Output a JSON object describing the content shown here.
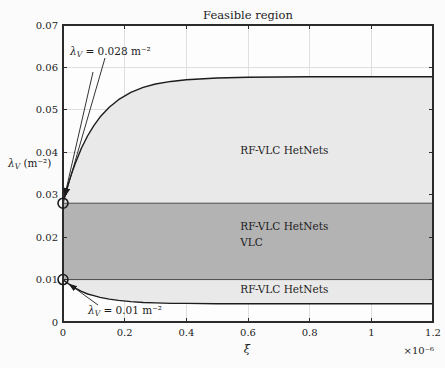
{
  "colors": {
    "background": "#fbfbfb",
    "plot_bg": "#fdfdfd",
    "light_region_fill": "#e9e9e9",
    "dark_region_fill": "#b3b3b3",
    "grid": "#dcdcdc",
    "axis": "#2b2b2b",
    "band_edge": "#4a4a4a",
    "curve": "#1c1c1c",
    "text": "#1c1c1c"
  },
  "chart_data": {
    "type": "area",
    "title": "Feasible region",
    "xlabel": "ξ",
    "x_scale_label": "×10⁻⁶",
    "ylabel": {
      "pre": "λ",
      "sub": "V",
      "post": " (m⁻²)"
    },
    "xlim": [
      0,
      1.2
    ],
    "ylim": [
      0,
      0.07
    ],
    "grid": true,
    "xticks": {
      "values": [
        0,
        0.2,
        0.4,
        0.6,
        0.8,
        1,
        1.2
      ],
      "labels": [
        "0",
        "0.2",
        "0.4",
        "0.6",
        "0.8",
        "1",
        "1.2"
      ]
    },
    "yticks": {
      "values": [
        0,
        0.01,
        0.02,
        0.03,
        0.04,
        0.05,
        0.06,
        0.07
      ],
      "labels": [
        "0",
        "0.01",
        "0.02",
        "0.03",
        "0.04",
        "0.05",
        "0.06",
        "0.07"
      ]
    },
    "series": [
      {
        "name": "upper-boundary-curve",
        "x": [
          0,
          0.01,
          0.02,
          0.03,
          0.04,
          0.06,
          0.08,
          0.1,
          0.12,
          0.15,
          0.18,
          0.22,
          0.26,
          0.3,
          0.35,
          0.4,
          0.5,
          0.6,
          0.8,
          1.0,
          1.2
        ],
        "y": [
          0.028,
          0.0307,
          0.0332,
          0.0354,
          0.0374,
          0.041,
          0.0439,
          0.0463,
          0.0483,
          0.0506,
          0.0524,
          0.0541,
          0.0553,
          0.0561,
          0.0567,
          0.0571,
          0.0575,
          0.0577,
          0.0578,
          0.0578,
          0.0578
        ]
      },
      {
        "name": "lower-boundary-curve",
        "x": [
          0,
          0.01,
          0.02,
          0.03,
          0.04,
          0.06,
          0.08,
          0.1,
          0.12,
          0.15,
          0.18,
          0.22,
          0.26,
          0.3,
          0.35,
          0.4,
          0.5,
          0.6,
          0.8,
          1.0,
          1.2
        ],
        "y": [
          0.01,
          0.0094,
          0.0089,
          0.0084,
          0.008,
          0.0072,
          0.0066,
          0.0062,
          0.0058,
          0.0054,
          0.0051,
          0.0048,
          0.0046,
          0.0045,
          0.0044,
          0.0044,
          0.0043,
          0.0043,
          0.0043,
          0.0043,
          0.0043
        ]
      }
    ],
    "band": {
      "y_top": 0.028,
      "y_bottom": 0.01
    },
    "regions": [
      {
        "name": "upper-region",
        "label_lines": [
          "RF-VLC HetNets"
        ],
        "anchor": {
          "x": 0.575,
          "y": [
            0.0405
          ]
        }
      },
      {
        "name": "middle-region",
        "label_lines": [
          "RF-VLC HetNets",
          "VLC"
        ],
        "anchor": {
          "x": 0.575,
          "y": [
            0.0225,
            0.0188
          ]
        }
      },
      {
        "name": "lower-region",
        "label_lines": [
          "RF-VLC HetNets"
        ],
        "anchor": {
          "x": 0.575,
          "y": [
            0.0077
          ]
        }
      }
    ],
    "annotations": [
      {
        "pre": "λ",
        "sub": "V",
        "post": " = 0.028 m⁻²",
        "target": {
          "x": 0,
          "y": 0.028
        },
        "text_px": {
          "x": 70,
          "y": 55
        },
        "arrows_from_px": [
          {
            "x": 105,
            "y": 58
          },
          {
            "x": 93,
            "y": 72
          }
        ]
      },
      {
        "pre": "λ",
        "sub": "V",
        "post": " = 0.01 m⁻²",
        "target": {
          "x": 0,
          "y": 0.01
        },
        "text_px": {
          "x": 88,
          "y": 314
        },
        "arrows_from_px": [
          {
            "x": 98,
            "y": 305
          }
        ]
      }
    ],
    "markers": [
      {
        "x": 0,
        "y": 0.028
      },
      {
        "x": 0,
        "y": 0.01
      }
    ]
  }
}
